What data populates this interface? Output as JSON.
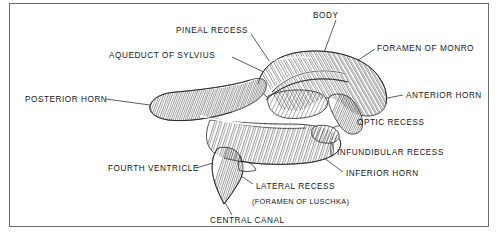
{
  "figure": {
    "style": "line engraving with hatched shading",
    "frame_color": "#6b6b6b",
    "background_color": "#ffffff",
    "ink_color": "#171717"
  },
  "labels": {
    "pineal_recess": "PINEAL RECESS",
    "aqueduct_of_sylvius": "AQUEDUCT OF SYLVIUS",
    "body": "BODY",
    "foramen_of_monro": "FORAMEN OF MONRO",
    "anterior_horn": "ANTERIOR HORN",
    "posterior_horn": "POSTERIOR HORN",
    "optic_recess": "OPTIC RECESS",
    "infundibular_recess": "INFUNDIBULAR RECESS",
    "inferior_horn": "INFERIOR HORN",
    "fourth_ventricle": "FOURTH VENTRICLE",
    "lateral_recess": "LATERAL RECESS",
    "foramen_of_luschka": "(FORAMEN OF LUSCHKA)",
    "central_canal": "CENTRAL CANAL"
  }
}
